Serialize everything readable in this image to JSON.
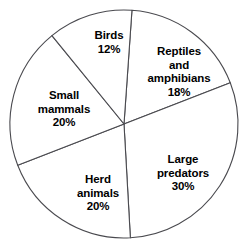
{
  "chart_data": {
    "type": "pie",
    "title": "",
    "subtitle": "",
    "xlabel": "",
    "ylabel": "",
    "legend": "none",
    "grid": false,
    "value_unit": "%",
    "total": 100,
    "start_angle_deg": 4,
    "direction": "clockwise",
    "categories": [
      "Reptiles and amphibians",
      "Large predators",
      "Herd animals",
      "Small mammals",
      "Birds"
    ],
    "values": [
      18,
      30,
      20,
      20,
      12
    ],
    "slices": [
      {
        "name": "reptiles-and-amphibians",
        "label_lines": [
          "Reptiles",
          "and",
          "amphibians"
        ],
        "percent_text": "18%",
        "value": 18,
        "fill": "#ffffff",
        "stroke": "#4a4a4f"
      },
      {
        "name": "large-predators",
        "label_lines": [
          "Large",
          "predators"
        ],
        "percent_text": "30%",
        "value": 30,
        "fill": "#ffffff",
        "stroke": "#4a4a4f"
      },
      {
        "name": "herd-animals",
        "label_lines": [
          "Herd",
          "animals"
        ],
        "percent_text": "20%",
        "value": 20,
        "fill": "#ffffff",
        "stroke": "#4a4a4f"
      },
      {
        "name": "small-mammals",
        "label_lines": [
          "Small",
          "mammals"
        ],
        "percent_text": "20%",
        "value": 20,
        "fill": "#ffffff",
        "stroke": "#4a4a4f"
      },
      {
        "name": "birds",
        "label_lines": [
          "Birds"
        ],
        "percent_text": "12%",
        "value": 12,
        "fill": "#ffffff",
        "stroke": "#4a4a4f"
      }
    ]
  },
  "labels": {
    "reptiles_line1": "Reptiles",
    "reptiles_line2": "and",
    "reptiles_line3": "amphibians",
    "reptiles_pct": "18%",
    "predators_line1": "Large",
    "predators_line2": "predators",
    "predators_pct": "30%",
    "herd_line1": "Herd",
    "herd_line2": "animals",
    "herd_pct": "20%",
    "mammals_line1": "Small",
    "mammals_line2": "mammals",
    "mammals_pct": "20%",
    "birds_line1": "Birds",
    "birds_pct": "12%"
  }
}
